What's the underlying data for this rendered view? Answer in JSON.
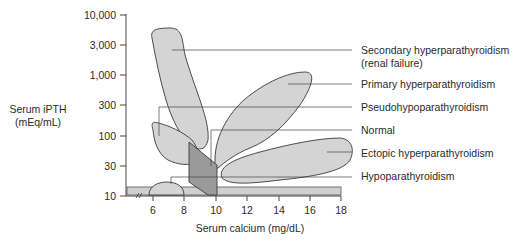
{
  "diagram": {
    "y_axis": {
      "title_line1": "Serum iPTH",
      "title_line2": "(mEq/mL)",
      "ticks": [
        "10,000",
        "3,000",
        "1,000",
        "300",
        "100",
        "30",
        "10"
      ],
      "scale": "log"
    },
    "x_axis": {
      "title": "Serum calcium (mg/dL)",
      "ticks": [
        "6",
        "8",
        "10",
        "12",
        "14",
        "16",
        "18"
      ],
      "break_mark": "//"
    },
    "labels": {
      "secondary_line1": "Secondary hyperparathyroidism",
      "secondary_line2": "(renal failure)",
      "primary": "Primary hyperparathyroidism",
      "pseudo": "Pseudohypoparathyroidism",
      "normal": "Normal",
      "ectopic": "Ectopic hyperparathyroidism",
      "hypo": "Hypoparathyroidism"
    },
    "colors": {
      "region_fill": "#d4d4d4",
      "normal_fill": "#9a9a9a",
      "outline": "#3a3a3a",
      "band_fill": "#cfcfcf"
    }
  }
}
